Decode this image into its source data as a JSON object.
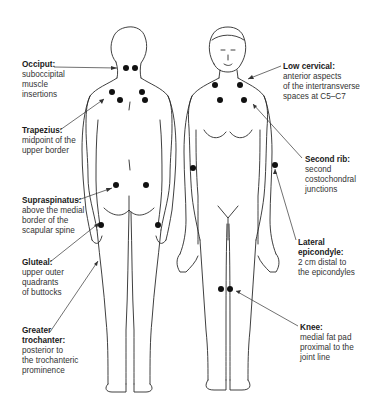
{
  "diagram": {
    "type": "anatomical tender points",
    "figures": [
      "posterior-view",
      "anterior-view"
    ],
    "labels": [
      {
        "id": "occiput",
        "title": "Occiput:",
        "desc": [
          "suboccipital",
          "muscle",
          "insertions"
        ],
        "x": 22,
        "y": 63,
        "target": [
          117,
          68
        ]
      },
      {
        "id": "trapezius",
        "title": "Trapezius:",
        "desc": [
          "midpoint of the",
          "upper border"
        ],
        "x": 22,
        "y": 127,
        "target": [
          104,
          99
        ]
      },
      {
        "id": "supraspinatus",
        "title": "Supraspinatus:",
        "desc": [
          "above the medial",
          "border of the",
          "scapular spine"
        ],
        "x": 22,
        "y": 196,
        "target": [
          112,
          188
        ]
      },
      {
        "id": "gluteal",
        "title": "Gluteal:",
        "desc": [
          "upper outer",
          "quadrants",
          "of buttocks"
        ],
        "x": 22,
        "y": 258,
        "target": [
          99,
          223
        ]
      },
      {
        "id": "greater-trochanter",
        "title": "Greater trochanter:",
        "desc": [
          "posterior to",
          "the trochanteric",
          "prominence"
        ],
        "x": 22,
        "y": 328,
        "target": [
          98,
          261
        ]
      },
      {
        "id": "low-cervical",
        "title": "Low cervical:",
        "desc": [
          "anterior aspects",
          "of the intertransverse",
          "spaces at C5–C7"
        ],
        "x": 283,
        "y": 62,
        "target": [
          248,
          79
        ]
      },
      {
        "id": "second-rib",
        "title": "Second rib:",
        "desc": [
          "second",
          "costochondral",
          "junctions"
        ],
        "x": 305,
        "y": 156,
        "target": [
          253,
          104
        ]
      },
      {
        "id": "lateral-epicondyle",
        "title": "Lateral epicondyle:",
        "desc": [
          "2 cm distal to",
          "the epicondyles"
        ],
        "x": 298,
        "y": 238,
        "target": [
          275,
          169
        ]
      },
      {
        "id": "knee",
        "title": "Knee:",
        "desc": [
          "medial fat pad",
          "proximal  to the",
          "joint line"
        ],
        "x": 300,
        "y": 324,
        "target": [
          244,
          291
        ]
      }
    ],
    "tender_points": {
      "posterior": [
        [
          126,
          68
        ],
        [
          135,
          68
        ],
        [
          112,
          92
        ],
        [
          142,
          92
        ],
        [
          120,
          100
        ],
        [
          145,
          100
        ],
        [
          116,
          185
        ],
        [
          146,
          185
        ],
        [
          101,
          225
        ],
        [
          158,
          225
        ]
      ],
      "anterior": [
        [
          215,
          85
        ],
        [
          240,
          85
        ],
        [
          220,
          100
        ],
        [
          244,
          100
        ],
        [
          193,
          168
        ],
        [
          275,
          165
        ],
        [
          221,
          289
        ],
        [
          230,
          289
        ]
      ]
    },
    "colors": {
      "line": "#2a2a2a",
      "dot": "#111111",
      "text": "#333333"
    }
  }
}
